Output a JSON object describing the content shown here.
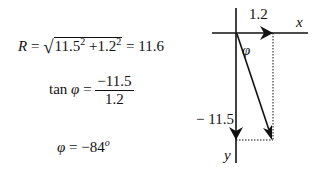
{
  "equations": {
    "magnitude": {
      "lhs": "R",
      "eq": "=",
      "term1": "11.5",
      "exp1": "2",
      "plus": "+",
      "term2": "1.2",
      "exp2": "2",
      "result": "= 11.6"
    },
    "tangent": {
      "lhs": "tan",
      "symbol": "φ",
      "eq": "=",
      "numerator": "−11.5",
      "denominator": "1.2"
    },
    "angle": {
      "symbol": "φ",
      "eq": "= −84",
      "unit": "o"
    }
  },
  "diagram": {
    "x_component_label": "1.2",
    "y_component_label": "− 11.5",
    "x_axis_label": "x",
    "y_axis_label": "y",
    "angle_label": "φ",
    "line_color": "#111111"
  }
}
